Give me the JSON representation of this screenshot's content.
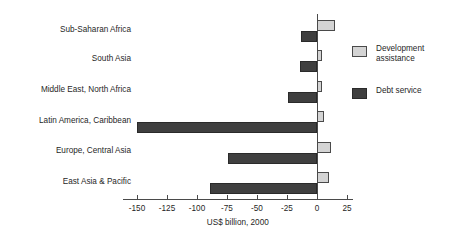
{
  "chart_data": {
    "type": "bar",
    "orientation": "horizontal",
    "title": "",
    "xlabel": "US$ billion, 2000",
    "ylabel": "",
    "xlim": [
      -162,
      30
    ],
    "xticks": [
      -150,
      -125,
      -100,
      -75,
      -50,
      -25,
      0,
      25
    ],
    "xtick_labels": [
      "-150",
      "-125",
      "-100",
      "-75",
      "-50",
      "-25",
      "0",
      "25"
    ],
    "grid": false,
    "legend_position": "right",
    "categories": [
      "Sub-Saharan Africa",
      "South Asia",
      "Middle East, North Africa",
      "Latin America, Caribbean",
      "Europe, Central Asia",
      "East Asia & Pacific"
    ],
    "series": [
      {
        "name": "Development assistance",
        "color": "#d4d4d4",
        "values": [
          15,
          4,
          4,
          6,
          12,
          10
        ]
      },
      {
        "name": "Debt service",
        "color": "#3f3f3f",
        "values": [
          -13,
          -14,
          -24,
          -150,
          -74,
          -89
        ]
      }
    ]
  },
  "legend": {
    "items": [
      {
        "label": "Development\nassistance",
        "icon": "square-swatch-light"
      },
      {
        "label": "Debt service",
        "icon": "square-swatch-dark"
      }
    ]
  },
  "axis": {
    "title": "US$ billion, 2000"
  }
}
